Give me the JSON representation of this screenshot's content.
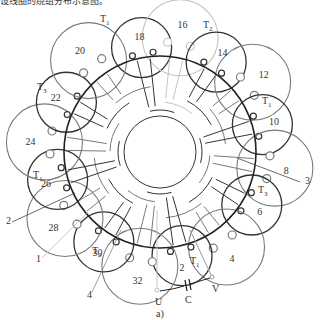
{
  "header_fragment": "设线圈的绕组分布示意图。",
  "colors": {
    "dark": "#333333",
    "mid": "#7a7a7a",
    "light": "#c4c4c4"
  },
  "center": {
    "x": 160,
    "y": 152
  },
  "rings": {
    "outer_r": 96,
    "inner_r": 36
  },
  "coils": [
    {
      "num": "18",
      "angle": -100,
      "tone": "dark"
    },
    {
      "num": "16",
      "angle": -80,
      "tone": "light"
    },
    {
      "num": "14",
      "angle": -58,
      "tone": "dark"
    },
    {
      "num": "12",
      "angle": -37,
      "tone": "mid"
    },
    {
      "num": "10",
      "angle": -15,
      "tone": "dark"
    },
    {
      "num": "8",
      "angle": 8,
      "tone": "mid"
    },
    {
      "num": "6",
      "angle": 30,
      "tone": "dark"
    },
    {
      "num": "4",
      "angle": 55,
      "tone": "mid"
    },
    {
      "num": "2",
      "angle": 78,
      "tone": "dark"
    },
    {
      "num": "32",
      "angle": 100,
      "tone": "mid"
    },
    {
      "num": "30",
      "angle": 122,
      "tone": "dark"
    },
    {
      "num": "28",
      "angle": 145,
      "tone": "mid"
    },
    {
      "num": "26",
      "angle": 165,
      "tone": "dark"
    },
    {
      "num": "24",
      "angle": 185,
      "tone": "mid"
    },
    {
      "num": "22",
      "angle": 208,
      "tone": "dark"
    },
    {
      "num": "20",
      "angle": 232,
      "tone": "mid"
    }
  ],
  "terminal_labels": [
    {
      "text": "T1",
      "x": 100,
      "y": 22
    },
    {
      "text": "T2",
      "x": 203,
      "y": 28
    },
    {
      "text": "T1",
      "x": 262,
      "y": 104
    },
    {
      "text": "T3",
      "x": 258,
      "y": 193
    },
    {
      "text": "T1",
      "x": 190,
      "y": 264
    },
    {
      "text": "T2",
      "x": 92,
      "y": 254
    },
    {
      "text": "T1",
      "x": 33,
      "y": 178
    },
    {
      "text": "T3",
      "x": 37,
      "y": 90
    }
  ],
  "callouts": [
    {
      "text": "1",
      "x": 36,
      "y": 262
    },
    {
      "text": "2",
      "x": 6,
      "y": 224
    },
    {
      "text": "3",
      "x": 305,
      "y": 184
    },
    {
      "text": "4",
      "x": 87,
      "y": 298
    }
  ],
  "circuit": {
    "U": "U",
    "V": "V",
    "C": "C",
    "caption": "a)"
  }
}
